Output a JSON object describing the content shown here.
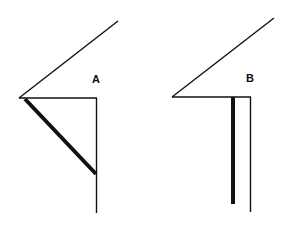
{
  "diagram": {
    "figures": [
      {
        "id": "A",
        "label": "A"
      },
      {
        "id": "B",
        "label": "B"
      }
    ],
    "colors": {
      "line": "#111111",
      "background": "#ffffff"
    }
  }
}
